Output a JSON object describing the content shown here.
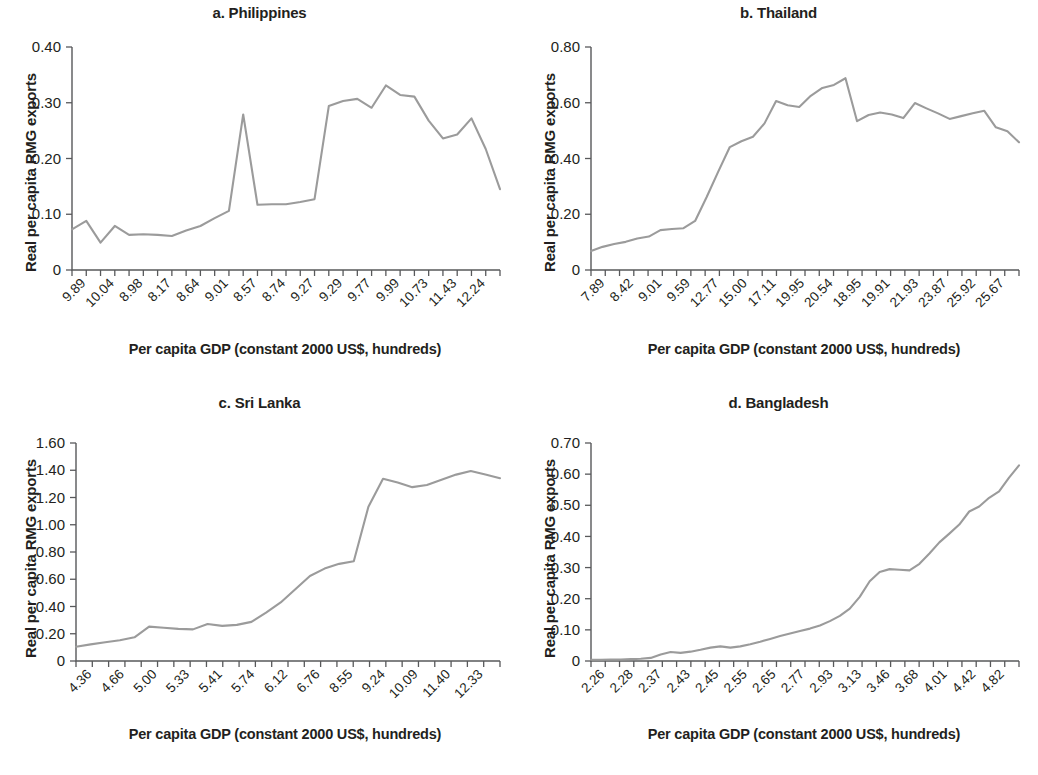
{
  "figure": {
    "background": "#ffffff",
    "line_color": "#9b9b9b",
    "axis_color": "#58595b",
    "text_color": "#231f20",
    "shared_xlabel": "Per capita GDP (constant 2000 US$, hundreds)",
    "shared_ylabel": "Real per capita RMG exports"
  },
  "chart_data": [
    {
      "type": "line",
      "panel": "a",
      "title": "a. Philippines",
      "xlabel": "Per capita GDP (constant 2000 US$, hundreds)",
      "ylabel": "Real per capita RMG exports",
      "grid": false,
      "legend": "none",
      "ylim": [
        0,
        0.4
      ],
      "ytick_labels": [
        "0.40",
        "0.30",
        "0.20",
        "0.10",
        "0"
      ],
      "ytick_values": [
        0.4,
        0.3,
        0.2,
        0.1,
        0
      ],
      "xtick_labels": [
        "9.89",
        "10.04",
        "8.98",
        "8.17",
        "8.64",
        "9.01",
        "8.57",
        "8.74",
        "9.27",
        "9.29",
        "9.77",
        "9.99",
        "10.73",
        "11.43",
        "12.24"
      ],
      "n_minor_ticks": 30,
      "values": [
        0.073,
        0.088,
        0.049,
        0.079,
        0.063,
        0.064,
        0.063,
        0.061,
        0.071,
        0.079,
        0.093,
        0.106,
        0.279,
        0.117,
        0.118,
        0.118,
        0.122,
        0.127,
        0.294,
        0.303,
        0.307,
        0.291,
        0.331,
        0.314,
        0.311,
        0.268,
        0.236,
        0.243,
        0.272,
        0.217,
        0.145
      ]
    },
    {
      "type": "line",
      "panel": "b",
      "title": "b. Thailand",
      "xlabel": "Per capita GDP (constant 2000 US$, hundreds)",
      "ylabel": "Real per capita RMG exports",
      "grid": false,
      "legend": "none",
      "ylim": [
        0,
        0.8
      ],
      "ytick_labels": [
        "0.80",
        "0.60",
        "0.40",
        "0.20",
        "0"
      ],
      "ytick_values": [
        0.8,
        0.6,
        0.4,
        0.2,
        0
      ],
      "xtick_labels": [
        "7.89",
        "8.42",
        "9.01",
        "9.59",
        "12.77",
        "15.00",
        "17.11",
        "19.95",
        "20.54",
        "18.95",
        "19.91",
        "21.93",
        "23.87",
        "25.92",
        "25.67"
      ],
      "n_minor_ticks": 30,
      "values": [
        0.068,
        0.083,
        0.093,
        0.101,
        0.113,
        0.12,
        0.143,
        0.147,
        0.15,
        0.176,
        0.262,
        0.353,
        0.441,
        0.462,
        0.478,
        0.526,
        0.606,
        0.591,
        0.585,
        0.625,
        0.653,
        0.664,
        0.688,
        0.534,
        0.556,
        0.565,
        0.558,
        0.545,
        0.599,
        0.58,
        0.562,
        0.542,
        0.552,
        0.562,
        0.571,
        0.512,
        0.498,
        0.458
      ]
    },
    {
      "type": "line",
      "panel": "c",
      "title": "c. Sri Lanka",
      "xlabel": "Per capita GDP (constant 2000 US$, hundreds)",
      "ylabel": "Real per capita RMG exports",
      "grid": false,
      "legend": "none",
      "ylim": [
        0,
        1.6
      ],
      "ytick_labels": [
        "1.60",
        "1.40",
        "1.20",
        "1.00",
        "0.80",
        "0.60",
        "0.40",
        "0.20",
        "0"
      ],
      "ytick_values": [
        1.6,
        1.4,
        1.2,
        1.0,
        0.8,
        0.6,
        0.4,
        0.2,
        0
      ],
      "xtick_labels": [
        "4.36",
        "4.66",
        "5.00",
        "5.33",
        "5.41",
        "5.74",
        "6.12",
        "6.76",
        "8.55",
        "9.24",
        "10.09",
        "11.40",
        "12.33"
      ],
      "n_minor_ticks": 26,
      "values": [
        0.105,
        0.122,
        0.137,
        0.152,
        0.174,
        0.252,
        0.244,
        0.236,
        0.232,
        0.272,
        0.258,
        0.265,
        0.287,
        0.355,
        0.43,
        0.527,
        0.624,
        0.678,
        0.713,
        0.732,
        1.132,
        1.338,
        1.31,
        1.276,
        1.292,
        1.33,
        1.368,
        1.395,
        1.369,
        1.341
      ]
    },
    {
      "type": "line",
      "panel": "d",
      "title": "d. Bangladesh",
      "xlabel": "Per capita GDP (constant 2000 US$, hundreds)",
      "ylabel": "Real per capita RMG exports",
      "grid": false,
      "legend": "none",
      "ylim": [
        0,
        0.7
      ],
      "ytick_labels": [
        "0.70",
        "0.60",
        "0.50",
        "0.40",
        "0.30",
        "0.20",
        "0.10",
        "0"
      ],
      "ytick_values": [
        0.7,
        0.6,
        0.5,
        0.4,
        0.3,
        0.2,
        0.1,
        0
      ],
      "xtick_labels": [
        "2.26",
        "2.28",
        "2.37",
        "2.43",
        "2.45",
        "2.55",
        "2.65",
        "2.77",
        "2.93",
        "3.13",
        "3.46",
        "3.68",
        "4.01",
        "4.42",
        "4.82"
      ],
      "n_minor_ticks": 30,
      "values": [
        0.004,
        0.004,
        0.005,
        0.005,
        0.006,
        0.007,
        0.01,
        0.021,
        0.029,
        0.026,
        0.03,
        0.036,
        0.043,
        0.047,
        0.043,
        0.047,
        0.054,
        0.062,
        0.071,
        0.08,
        0.088,
        0.096,
        0.104,
        0.114,
        0.128,
        0.145,
        0.168,
        0.206,
        0.256,
        0.286,
        0.295,
        0.293,
        0.291,
        0.312,
        0.345,
        0.381,
        0.409,
        0.438,
        0.48,
        0.496,
        0.524,
        0.545,
        0.589,
        0.628
      ]
    }
  ]
}
